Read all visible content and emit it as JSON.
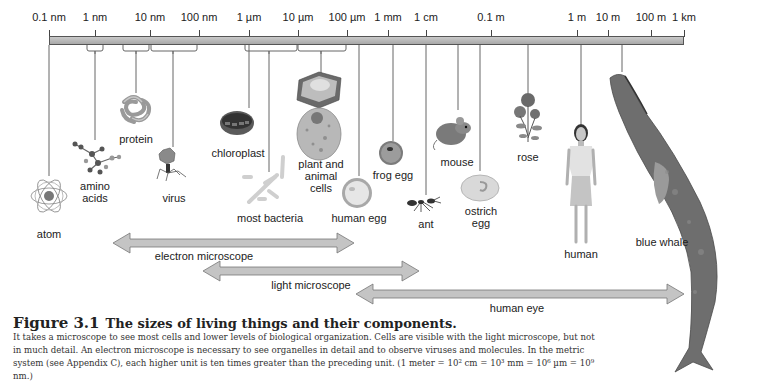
{
  "scale": {
    "ticks": [
      {
        "label": "0.1 nm",
        "x": 49
      },
      {
        "label": "1 nm",
        "x": 95
      },
      {
        "label": "10 nm",
        "x": 150
      },
      {
        "label": "100 nm",
        "x": 199
      },
      {
        "label": "1 µm",
        "x": 249
      },
      {
        "label": "10 µm",
        "x": 298
      },
      {
        "label": "100 µm",
        "x": 347
      },
      {
        "label": "1 mm",
        "x": 388
      },
      {
        "label": "1 cm",
        "x": 426
      },
      {
        "label": "0.1 m",
        "x": 491
      },
      {
        "label": "1 m",
        "x": 577
      },
      {
        "label": "10 m",
        "x": 608
      },
      {
        "label": "100 m",
        "x": 651
      },
      {
        "label": "1 km",
        "x": 684
      }
    ]
  },
  "objects": [
    {
      "name": "atom",
      "label": "atom"
    },
    {
      "name": "amino-acids",
      "label_line1": "amino",
      "label_line2": "acids"
    },
    {
      "name": "protein",
      "label": "protein"
    },
    {
      "name": "virus",
      "label": "virus"
    },
    {
      "name": "chloroplast",
      "label": "chloroplast"
    },
    {
      "name": "most-bacteria",
      "label": "most bacteria"
    },
    {
      "name": "plant-and-animal-cells",
      "label_line1": "plant and",
      "label_line2": "animal",
      "label_line3": "cells"
    },
    {
      "name": "human-egg",
      "label": "human egg"
    },
    {
      "name": "frog-egg",
      "label": "frog egg"
    },
    {
      "name": "ant",
      "label": "ant"
    },
    {
      "name": "mouse",
      "label": "mouse"
    },
    {
      "name": "ostrich-egg",
      "label_line1": "ostrich",
      "label_line2": "egg"
    },
    {
      "name": "rose",
      "label": "rose"
    },
    {
      "name": "human",
      "label": "human"
    },
    {
      "name": "blue-whale",
      "label": "blue whale"
    }
  ],
  "ranges": [
    {
      "name": "electron-microscope",
      "label": "electron microscope",
      "from": "0.1 nm",
      "to": "100 µm"
    },
    {
      "name": "light-microscope",
      "label": "light microscope",
      "from": "100 nm",
      "to": "1 cm"
    },
    {
      "name": "human-eye",
      "label": "human eye",
      "from": "100 µm",
      "to": "1 km"
    }
  ],
  "caption": {
    "figure_number": "Figure 3.1",
    "title": "The sizes of living things and their components.",
    "body": "It takes a microscope to see most cells and lower levels of biological organization. Cells are visible with the light microscope, but not in much detail. An electron microscope is necessary to see organelles in detail and to observe viruses and molecules. In the metric system (see Appendix C), each higher unit is ten times greater than the preceding unit. (1 meter = 10² cm = 10³ mm = 10⁶ µm = 10⁹ nm.)"
  },
  "colors": {
    "scale_bar": "#b5b5b5",
    "arrow_fill": "#c4c4c4",
    "arrow_stroke": "#777777",
    "text": "#222222"
  }
}
